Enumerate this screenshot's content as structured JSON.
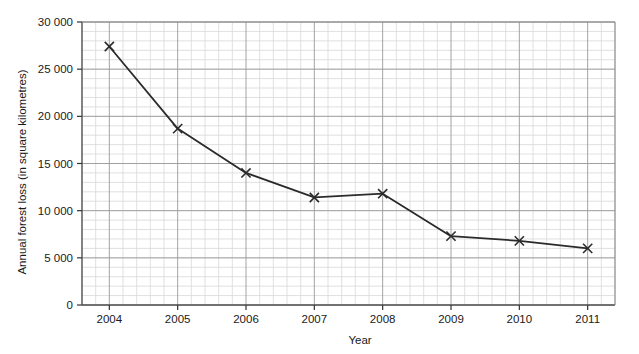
{
  "chart_data": {
    "type": "line",
    "title": "",
    "xlabel": "Year",
    "ylabel": "Annual forest loss (in square kilometres)",
    "categories": [
      "2004",
      "2005",
      "2006",
      "2007",
      "2008",
      "2009",
      "2010",
      "2011"
    ],
    "x": [
      2004,
      2005,
      2006,
      2007,
      2008,
      2009,
      2010,
      2011
    ],
    "values": [
      27400,
      18700,
      14000,
      11400,
      11800,
      7300,
      6800,
      6000
    ],
    "series": [
      {
        "name": "Annual forest loss",
        "values": [
          27400,
          18700,
          14000,
          11400,
          11800,
          7300,
          6800,
          6000
        ]
      }
    ],
    "xlim": [
      2003.6,
      2011.4
    ],
    "ylim": [
      0,
      30000
    ],
    "y_ticks": [
      0,
      5000,
      10000,
      15000,
      20000,
      25000,
      30000
    ],
    "y_tick_labels": [
      "0",
      "5000",
      "10000",
      "15000",
      "20000",
      "25000",
      "30000"
    ],
    "x_ticks": [
      2004,
      2005,
      2006,
      2007,
      2008,
      2009,
      2010,
      2011
    ],
    "x_tick_labels": [
      "2004",
      "2005",
      "2006",
      "2007",
      "2008",
      "2009",
      "2010",
      "2011"
    ],
    "y_minor_step": 1000,
    "x_minor_divisions": 5,
    "grid": true,
    "grid_major_color": "#9a9a9a",
    "grid_minor_color": "#d8d8d8",
    "line_color": "#2b2b2b",
    "marker": "x",
    "marker_color": "#2b2b2b",
    "legend": null,
    "legend_position": "none"
  },
  "axis": {
    "y_label": "Annual forest loss (in square kilometres)",
    "x_label": "Year"
  }
}
